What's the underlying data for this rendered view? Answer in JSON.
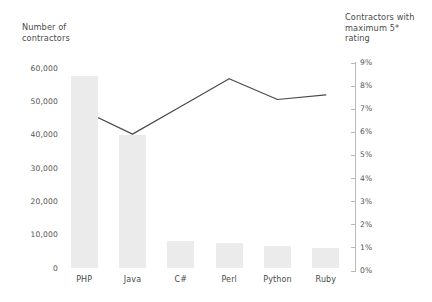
{
  "chart_data": {
    "type": "bar",
    "title": "",
    "subtitle": "",
    "categories": [
      "PHP",
      "Java",
      "C#",
      "Perl",
      "Python",
      "Ruby"
    ],
    "series": [
      {
        "name": "Number of contractors",
        "type": "bar",
        "axis": "left",
        "values": [
          57500,
          40000,
          8200,
          7600,
          6700,
          6100
        ],
        "color": "#ebebeb"
      },
      {
        "name": "Contractors with maximum 5* rating",
        "type": "line",
        "axis": "right",
        "values": [
          6.9,
          5.9,
          7.1,
          8.3,
          7.4,
          7.6
        ],
        "color": "#4a4a4a"
      }
    ],
    "xlabel": "",
    "ylabel": "Number of contractors",
    "y2label": "Contractors with maximum 5* rating",
    "ylim": [
      0,
      60000
    ],
    "y2lim": [
      0,
      9
    ],
    "yticks": [
      "0",
      "10,000",
      "20,000",
      "30,000",
      "40,000",
      "50,000",
      "60,000"
    ],
    "ytick_values": [
      0,
      10000,
      20000,
      30000,
      40000,
      50000,
      60000
    ],
    "y2ticks": [
      "0%",
      "1%",
      "2%",
      "3%",
      "4%",
      "5%",
      "6%",
      "7%",
      "8%",
      "9%"
    ],
    "y2tick_values": [
      0,
      1,
      2,
      3,
      4,
      5,
      6,
      7,
      8,
      9
    ],
    "grid": false,
    "legend": "none",
    "background": "#ffffff"
  },
  "axes": {
    "left": {
      "title_line1": "Number of",
      "title_line2": "contractors",
      "ticks": [
        "60,000",
        "50,000",
        "40,000",
        "30,000",
        "20,000",
        "10,000",
        "0"
      ]
    },
    "right": {
      "title_line1": "Contractors with",
      "title_line2": "maximum 5*",
      "title_line3": "rating",
      "ticks": [
        "9%",
        "8%",
        "7%",
        "6%",
        "5%",
        "4%",
        "3%",
        "2%",
        "1%",
        "0%"
      ]
    },
    "categories": [
      "PHP",
      "Java",
      "C#",
      "Perl",
      "Python",
      "Ruby"
    ]
  },
  "colors": {
    "bar": "#ebebeb",
    "line": "#4a4a4a",
    "text": "#4a4a4a",
    "axis": "#b9b9b9",
    "background": "#ffffff"
  }
}
